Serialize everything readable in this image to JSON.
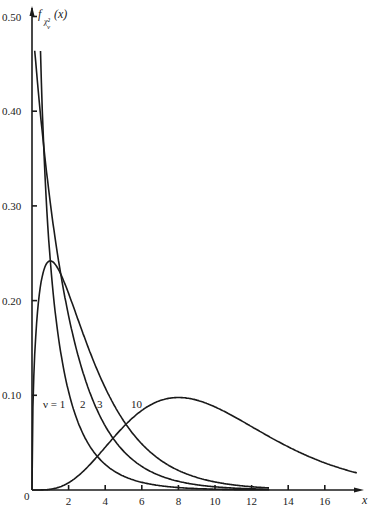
{
  "chart_data": {
    "type": "line",
    "title": "",
    "ylabel": "f_{χ²_ν}(x)",
    "xlabel": "x",
    "xlim": [
      0,
      18
    ],
    "ylim": [
      0,
      0.5
    ],
    "x_ticks": [
      2,
      4,
      6,
      8,
      10,
      12,
      14,
      16
    ],
    "y_ticks": [
      0.1,
      0.2,
      0.3,
      0.4,
      0.5
    ],
    "y_tick_labels": [
      "0.10",
      "0.20",
      "0.30",
      "0.40",
      "0.50"
    ],
    "x_tick_labels": [
      "2",
      "4",
      "6",
      "8",
      "10",
      "12",
      "14",
      "16"
    ],
    "origin_label": "0",
    "grid": false,
    "legend": "inline curve labels",
    "series": [
      {
        "name": "ν = 1",
        "df": 1,
        "label": "ν = 1",
        "peak": "→∞ at x=0"
      },
      {
        "name": "2",
        "df": 2,
        "label": "2",
        "peak": 0.5,
        "peak_x": 0
      },
      {
        "name": "3",
        "df": 3,
        "label": "3",
        "peak": 0.242,
        "peak_x": 1
      },
      {
        "name": "10",
        "df": 10,
        "label": "10",
        "peak": 0.095,
        "peak_x": 8
      }
    ]
  },
  "labels": {
    "y_axis_title": "f",
    "y_axis_sub": "χ²",
    "y_axis_sub2": "ν",
    "y_axis_arg": "(x)",
    "x_axis_title": "x",
    "nu1": "ν = 1",
    "nu2": "2",
    "nu3": "3",
    "nu10": "10"
  }
}
